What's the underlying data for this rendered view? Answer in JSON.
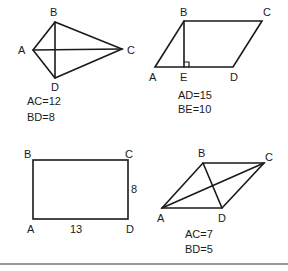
{
  "figures": [
    {
      "name": "kite",
      "vertices": {
        "A": "A",
        "B": "B",
        "C": "C",
        "D": "D"
      },
      "givens": [
        "AC=12",
        "BD=8"
      ]
    },
    {
      "name": "parallelogram",
      "vertices": {
        "A": "A",
        "B": "B",
        "C": "C",
        "D": "D",
        "E": "E"
      },
      "givens": [
        "AD=15",
        "BE=10"
      ]
    },
    {
      "name": "rectangle",
      "vertices": {
        "A": "A",
        "B": "B",
        "C": "C",
        "D": "D"
      },
      "side_labels": {
        "width": "13",
        "height": "8"
      }
    },
    {
      "name": "rhombus",
      "vertices": {
        "A": "A",
        "B": "B",
        "C": "C",
        "D": "D"
      },
      "givens": [
        "AC=7",
        "BD=5"
      ]
    }
  ]
}
